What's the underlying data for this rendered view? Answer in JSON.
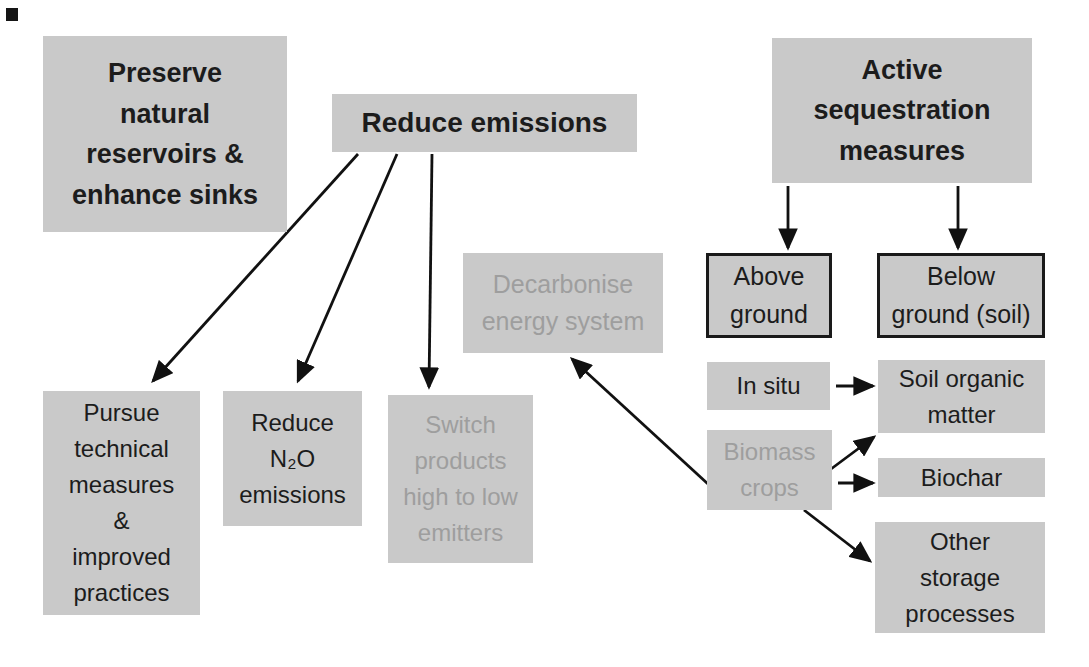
{
  "figure": {
    "background_color": "#ffffff",
    "box_fill_color": "#c9c9c9",
    "box_border_color": "#1a1a1a",
    "arrow_color": "#111111",
    "text_color_primary": "#1c1c1c",
    "text_color_muted": "#9e9e9e",
    "corner_mark": {
      "x": 6,
      "y": 8,
      "w": 12,
      "h": 13
    },
    "nodes": [
      {
        "id": "preserve-natural-reservoirs",
        "lines": [
          "Preserve",
          "natural",
          "reservoirs &",
          "enhance sinks"
        ],
        "x": 43,
        "y": 36,
        "w": 244,
        "h": 196,
        "bold": true,
        "gray_text": false,
        "bordered": false,
        "font_size": 27
      },
      {
        "id": "reduce-emissions",
        "lines": [
          "Reduce emissions"
        ],
        "x": 332,
        "y": 94,
        "w": 305,
        "h": 58,
        "bold": true,
        "gray_text": false,
        "bordered": false,
        "font_size": 28
      },
      {
        "id": "active-sequestration",
        "lines": [
          "Active",
          "sequestration",
          "measures"
        ],
        "x": 772,
        "y": 38,
        "w": 260,
        "h": 145,
        "bold": true,
        "gray_text": false,
        "bordered": false,
        "font_size": 27
      },
      {
        "id": "decarbonise-energy-system",
        "lines": [
          "Decarbonise",
          "energy system"
        ],
        "x": 463,
        "y": 253,
        "w": 200,
        "h": 100,
        "bold": false,
        "gray_text": true,
        "bordered": false,
        "font_size": 25
      },
      {
        "id": "above-ground",
        "lines": [
          "Above",
          "ground"
        ],
        "x": 706,
        "y": 253,
        "w": 126,
        "h": 85,
        "bold": false,
        "gray_text": false,
        "bordered": true,
        "font_size": 25
      },
      {
        "id": "below-ground-soil",
        "lines": [
          "Below",
          "ground (soil)"
        ],
        "x": 877,
        "y": 253,
        "w": 168,
        "h": 85,
        "bold": false,
        "gray_text": false,
        "bordered": true,
        "font_size": 25
      },
      {
        "id": "pursue-technical-measures",
        "lines": [
          "Pursue",
          "technical",
          "measures",
          "&",
          "improved",
          "practices"
        ],
        "x": 43,
        "y": 391,
        "w": 157,
        "h": 224,
        "bold": false,
        "gray_text": false,
        "bordered": false,
        "font_size": 24
      },
      {
        "id": "reduce-n2o-emissions",
        "lines": [
          "Reduce",
          "N₂O",
          "emissions"
        ],
        "x": 223,
        "y": 391,
        "w": 139,
        "h": 135,
        "bold": false,
        "gray_text": false,
        "bordered": false,
        "font_size": 24
      },
      {
        "id": "switch-products",
        "lines": [
          "Switch",
          "products",
          "high to low",
          "emitters"
        ],
        "x": 388,
        "y": 395,
        "w": 145,
        "h": 168,
        "bold": false,
        "gray_text": true,
        "bordered": false,
        "font_size": 24
      },
      {
        "id": "in-situ",
        "lines": [
          "In situ"
        ],
        "x": 707,
        "y": 362,
        "w": 123,
        "h": 48,
        "bold": false,
        "gray_text": false,
        "bordered": false,
        "font_size": 24
      },
      {
        "id": "soil-organic-matter",
        "lines": [
          "Soil organic",
          "matter"
        ],
        "x": 878,
        "y": 360,
        "w": 167,
        "h": 73,
        "bold": false,
        "gray_text": false,
        "bordered": false,
        "font_size": 24
      },
      {
        "id": "biomass-crops",
        "lines": [
          "Biomass",
          "crops"
        ],
        "x": 707,
        "y": 430,
        "w": 125,
        "h": 80,
        "bold": false,
        "gray_text": true,
        "bordered": false,
        "font_size": 24
      },
      {
        "id": "biochar",
        "lines": [
          "Biochar"
        ],
        "x": 878,
        "y": 458,
        "w": 167,
        "h": 39,
        "bold": false,
        "gray_text": false,
        "bordered": false,
        "font_size": 24
      },
      {
        "id": "other-storage-processes",
        "lines": [
          "Other",
          "storage",
          "processes"
        ],
        "x": 875,
        "y": 522,
        "w": 170,
        "h": 111,
        "bold": false,
        "gray_text": false,
        "bordered": false,
        "font_size": 24
      }
    ],
    "edges": [
      {
        "from": "reduce-emissions",
        "to": "pursue-technical-measures",
        "x1": 358,
        "y1": 154,
        "x2": 153,
        "y2": 381
      },
      {
        "from": "reduce-emissions",
        "to": "reduce-n2o-emissions",
        "x1": 397,
        "y1": 154,
        "x2": 298,
        "y2": 381
      },
      {
        "from": "reduce-emissions",
        "to": "switch-products",
        "x1": 432,
        "y1": 154,
        "x2": 429,
        "y2": 387
      },
      {
        "from": "active-sequestration",
        "to": "above-ground",
        "x1": 788,
        "y1": 186,
        "x2": 788,
        "y2": 248
      },
      {
        "from": "active-sequestration",
        "to": "below-ground-soil",
        "x1": 958,
        "y1": 186,
        "x2": 958,
        "y2": 248
      },
      {
        "from": "in-situ",
        "to": "soil-organic-matter",
        "x1": 836,
        "y1": 386,
        "x2": 873,
        "y2": 386
      },
      {
        "from": "biomass-crops",
        "to": "soil-organic-matter",
        "x1": 831,
        "y1": 469,
        "x2": 874,
        "y2": 437
      },
      {
        "from": "biomass-crops",
        "to": "biochar",
        "x1": 838,
        "y1": 483,
        "x2": 873,
        "y2": 483
      },
      {
        "from": "biomass-crops",
        "to": "other-storage-processes",
        "x1": 804,
        "y1": 510,
        "x2": 870,
        "y2": 561
      },
      {
        "from": "biomass-crops",
        "to": "decarbonise-energy-system",
        "x1": 708,
        "y1": 484,
        "x2": 572,
        "y2": 359
      }
    ]
  }
}
